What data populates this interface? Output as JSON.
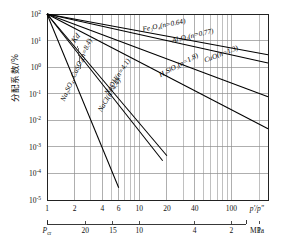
{
  "chart_data": {
    "type": "line",
    "title": "",
    "xlabel": "p'/p\"",
    "ylabel": "分配系数/%",
    "secondary_xlabel": "MPa",
    "xscale": "log",
    "yscale": "log",
    "xlim": [
      1,
      250
    ],
    "ylim": [
      1e-05,
      100
    ],
    "grid": true,
    "legend": "inline-labels",
    "x_ticks": [
      {
        "value": 1,
        "label": "1"
      },
      {
        "value": 2,
        "label": "2"
      },
      {
        "value": 4,
        "label": "4"
      },
      {
        "value": 6,
        "label": "6"
      },
      {
        "value": 10,
        "label": "10"
      },
      {
        "value": 20,
        "label": "20"
      },
      {
        "value": 40,
        "label": "40"
      },
      {
        "value": 100,
        "label": "100"
      }
    ],
    "x_minor_ticks": [
      3,
      5,
      7,
      8,
      9,
      30,
      50,
      60,
      70,
      80,
      90,
      200
    ],
    "y_ticks": [
      {
        "value": 100,
        "label": "10",
        "exp": "2"
      },
      {
        "value": 10,
        "label": "10",
        "exp": "1"
      },
      {
        "value": 1,
        "label": "10",
        "exp": "0"
      },
      {
        "value": 0.1,
        "label": "10",
        "exp": "-1"
      },
      {
        "value": 0.01,
        "label": "10",
        "exp": "-2"
      },
      {
        "value": 0.001,
        "label": "10",
        "exp": "-3"
      },
      {
        "value": 0.0001,
        "label": "10",
        "exp": "-4"
      },
      {
        "value": 1e-05,
        "label": "10",
        "exp": "-5"
      }
    ],
    "secondary_x_ticks": [
      {
        "pos": 1,
        "label": "P",
        "sub": "cr"
      },
      {
        "pos": 2.6,
        "label": "20",
        "sub": ""
      },
      {
        "pos": 5.2,
        "label": "15",
        "sub": ""
      },
      {
        "pos": 10,
        "label": "10",
        "sub": ""
      },
      {
        "pos": 40,
        "label": "4",
        "sub": ""
      },
      {
        "pos": 100,
        "label": "2",
        "sub": ""
      },
      {
        "pos": 200,
        "label": "1",
        "sub": ""
      }
    ],
    "annotation": {
      "text": "Kd",
      "x": 2.0,
      "y": 8
    },
    "series": [
      {
        "name": "Fe3O4",
        "label": "Fe₃O₄(n=0.64)",
        "n": 0.64,
        "x0": 1,
        "y0": 100,
        "x1": 250,
        "label_x": 11,
        "label_y": 22,
        "label_angle": -11
      },
      {
        "name": "Al2O3",
        "label": "Al₂O₃(n=0.77)",
        "n": 0.77,
        "x0": 1,
        "y0": 100,
        "x1": 250,
        "label_x": 23,
        "label_y": 8.5,
        "label_angle": -13
      },
      {
        "name": "CuO",
        "label": "CuO(n=1.3)",
        "n": 1.3,
        "x0": 1,
        "y0": 100,
        "x1": 250,
        "label_x": 52,
        "label_y": 1.5,
        "label_angle": -21
      },
      {
        "name": "H2SiO3",
        "label": "H₂SiO₃(n=1.8)",
        "n": 1.8,
        "x0": 1,
        "y0": 100,
        "x1": 250,
        "label_x": 17,
        "label_y": 0.42,
        "label_angle": -28
      },
      {
        "name": "NaOH",
        "label": "NaOH(n=4.1)",
        "n": 4.1,
        "x0": 1,
        "y0": 100,
        "x1": 20,
        "label_x": 4.6,
        "label_y": 0.09,
        "label_angle": -57
      },
      {
        "name": "NaCl",
        "label": "NaCl(n=4.4)",
        "n": 4.4,
        "x0": 1,
        "y0": 100,
        "x1": 18,
        "label_x": 3.9,
        "label_y": 0.02,
        "label_angle": -59
      },
      {
        "name": "Na2SO4_CaSO4",
        "label": "Na₂SO₄, CaSO₄(n=8.4)",
        "n": 8.4,
        "x0": 1,
        "y0": 100,
        "x1": 6,
        "label_x": 1.55,
        "label_y": 0.05,
        "label_angle": -66
      }
    ]
  },
  "axis_labels": {
    "x_primary": "p'/p\"",
    "x_secondary_unit": "MPa",
    "y": "分配系数/%"
  }
}
